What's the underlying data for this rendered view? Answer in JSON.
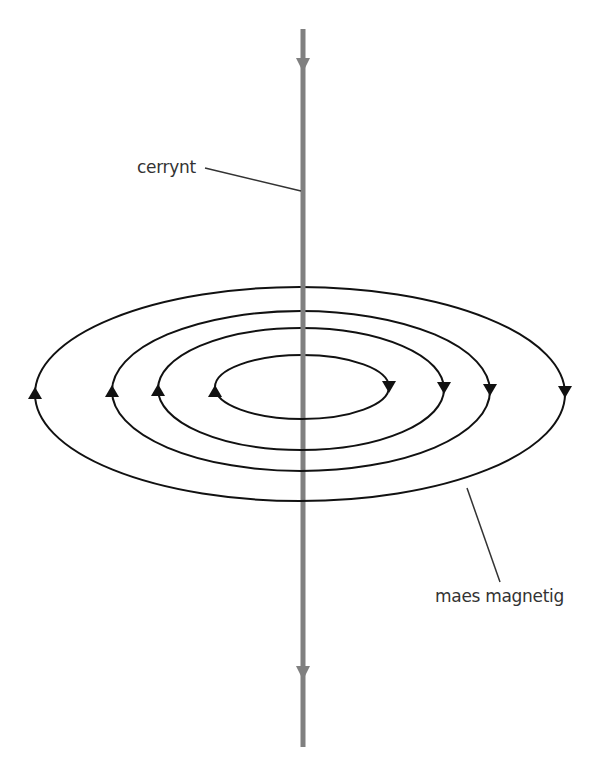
{
  "diagram": {
    "labels": {
      "current": "cerrynt",
      "magnetic_field": "maes magnetig"
    },
    "colors": {
      "wire": "#808080",
      "field_lines": "#111111",
      "leader_lines": "#333333",
      "text": "#333333",
      "background": "#ffffff"
    },
    "wire": {
      "x": 303,
      "y_top": 29,
      "y_bottom": 747,
      "width": 5,
      "current_direction": "down",
      "arrows_y": [
        63,
        673
      ]
    },
    "field_lines": [
      {
        "name": "outer",
        "cx": 300,
        "cy": 394,
        "rx": 265,
        "ry": 107,
        "direction": "clockwise-from-above"
      },
      {
        "name": "second",
        "cx": 301,
        "cy": 391,
        "rx": 189,
        "ry": 80,
        "direction": "clockwise-from-above"
      },
      {
        "name": "third",
        "cx": 301,
        "cy": 389,
        "rx": 143,
        "ry": 61,
        "direction": "clockwise-from-above"
      },
      {
        "name": "inner",
        "cx": 302,
        "cy": 387,
        "rx": 87,
        "ry": 32,
        "direction": "clockwise-from-above"
      }
    ],
    "leaders": {
      "current": {
        "x1": 205,
        "y1": 168,
        "x2": 301,
        "y2": 191
      },
      "magnetic_field": {
        "x1": 467,
        "y1": 488,
        "x2": 500,
        "y2": 582
      }
    }
  }
}
